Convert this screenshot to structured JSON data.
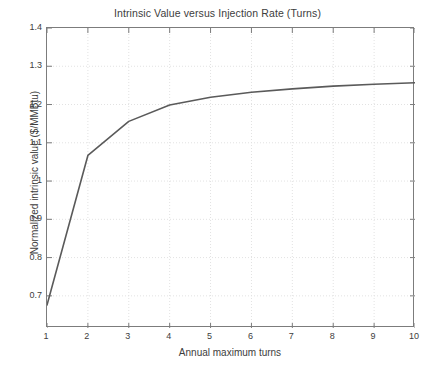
{
  "chart_data": {
    "type": "line",
    "title": "Intrinsic Value versus Injection Rate (Turns)",
    "xlabel": "Annual maximum turns",
    "ylabel": "Normalized intrinsic value ($/MMBtu)",
    "x": [
      1,
      2,
      3,
      4,
      5,
      6,
      7,
      8,
      9,
      10
    ],
    "values": [
      0.676,
      1.067,
      1.156,
      1.199,
      1.219,
      1.232,
      1.241,
      1.248,
      1.253,
      1.257
    ],
    "series": [
      {
        "name": "Normalized intrinsic value",
        "values": [
          0.676,
          1.067,
          1.156,
          1.199,
          1.219,
          1.232,
          1.241,
          1.248,
          1.253,
          1.257
        ]
      }
    ],
    "xlim": [
      1,
      10
    ],
    "ylim": [
      0.616,
      1.4
    ],
    "xticks": [
      1,
      2,
      3,
      4,
      5,
      6,
      7,
      8,
      9,
      10
    ],
    "xtick_labels": [
      "1",
      "2",
      "3",
      "4",
      "5",
      "6",
      "7",
      "8",
      "9",
      "10"
    ],
    "yticks": [
      0.7,
      0.8,
      0.9,
      1.0,
      1.1,
      1.2,
      1.3,
      1.4
    ],
    "ytick_labels": [
      "0.7",
      "0.8",
      "0.9",
      "1",
      "1.1",
      "1.2",
      "1.3",
      "1.4"
    ],
    "grid": true,
    "grid_style": "dotted",
    "legend": null,
    "line_color": "#5a5a5a",
    "grid_color": "#e2e2e2",
    "axis_color": "#7c7c7c",
    "background_color": "#ffffff"
  }
}
